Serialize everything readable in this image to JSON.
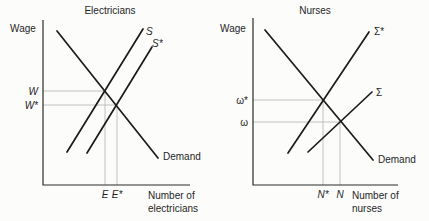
{
  "figure": {
    "bg_color": "#fcfcfb",
    "curve_color": "#1b1b1b",
    "axis_color": "#2a2a2a",
    "guide_color": "#b3b3b3",
    "text_color": "#1f1f1f",
    "panels": [
      {
        "title": "Electricians",
        "y_label": "Wage",
        "x_label_line1": "Number of",
        "x_label_line2": "electricians",
        "axis": {
          "x0": 43,
          "y_top": 20,
          "y0": 185,
          "x_right": 190
        },
        "curves": [
          {
            "name": "demand-curve",
            "label": "Demand",
            "italic": false,
            "x1": 57,
            "y1": 31,
            "x2": 158,
            "y2": 158,
            "lx": 163,
            "ly": 160
          },
          {
            "name": "supply-curve-S",
            "label": "S",
            "italic": true,
            "x1": 67,
            "y1": 152,
            "x2": 143,
            "y2": 29,
            "lx": 146,
            "ly": 35
          },
          {
            "name": "supply-curve-S-star",
            "label": "S*",
            "italic": true,
            "x1": 87,
            "y1": 153,
            "x2": 152,
            "y2": 47,
            "lx": 152,
            "ly": 47
          }
        ],
        "equilibria": [
          {
            "x": 105,
            "y": 91,
            "wage_label": "W",
            "qty_label": "E",
            "italic_wage": true,
            "italic_qty": true
          },
          {
            "x": 117,
            "y": 105,
            "wage_label": "W*",
            "qty_label": "E*",
            "italic_wage": true,
            "italic_qty": true
          }
        ]
      },
      {
        "title": "Nurses",
        "y_label": "Wage",
        "x_label_line1": "Number of",
        "x_label_line2": "nurses",
        "axis": {
          "x0": 253,
          "y_top": 18,
          "y0": 185,
          "x_right": 398
        },
        "curves": [
          {
            "name": "demand-curve",
            "label": "Demand",
            "italic": false,
            "x1": 265,
            "y1": 30,
            "x2": 373,
            "y2": 160,
            "lx": 378,
            "ly": 163
          },
          {
            "name": "supply-curve-sigma-star",
            "label": "Σ*",
            "italic": false,
            "x1": 288,
            "y1": 153,
            "x2": 369,
            "y2": 32,
            "lx": 374,
            "ly": 35
          },
          {
            "name": "supply-curve-sigma",
            "label": "Σ",
            "italic": false,
            "x1": 308,
            "y1": 152,
            "x2": 372,
            "y2": 92,
            "lx": 376,
            "ly": 96
          }
        ],
        "equilibria": [
          {
            "x": 323,
            "y": 100,
            "wage_label": "ω*",
            "qty_label": "N*",
            "italic_wage": false,
            "italic_qty": true
          },
          {
            "x": 340,
            "y": 122,
            "wage_label": "ω",
            "qty_label": "N",
            "italic_wage": false,
            "italic_qty": true
          }
        ]
      }
    ]
  }
}
